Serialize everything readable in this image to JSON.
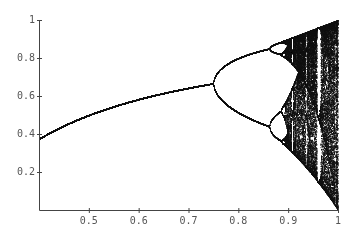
{
  "chart_data": {
    "type": "scatter",
    "title": "",
    "xlabel": "",
    "ylabel": "",
    "xlim": [
      0.4,
      1.0
    ],
    "ylim": [
      0.0,
      1.0
    ],
    "grid": false,
    "legend": null,
    "x_ticks": [
      "0.5",
      "0.6",
      "0.7",
      "0.8",
      "0.9",
      "1"
    ],
    "y_ticks": [
      "0.2",
      "0.4",
      "0.6",
      "0.8",
      "1"
    ],
    "key_points": [
      {
        "x": 0.4,
        "y": 0.375,
        "note": "stable fixed point at left edge"
      },
      {
        "x": 0.7,
        "y": 0.64,
        "note": "fixed point before first bifurcation"
      },
      {
        "x": 0.75,
        "y": 0.667,
        "note": "period-doubling to 2-cycle"
      },
      {
        "x": 0.86,
        "y": [
          0.44,
          0.85
        ],
        "note": "period-4 region"
      },
      {
        "x": 0.89,
        "y": [
          0.3,
          0.89
        ],
        "note": "onset of chaos"
      },
      {
        "x": 0.957,
        "y": "period-3 window (white band)"
      },
      {
        "x": 1.0,
        "y": [
          0.0,
          1.0
        ],
        "note": "full chaos"
      }
    ],
    "map_parameter_scale": 4
  },
  "colors": {
    "ink": "#111111",
    "axis": "#444444",
    "background": "#ffffff"
  }
}
